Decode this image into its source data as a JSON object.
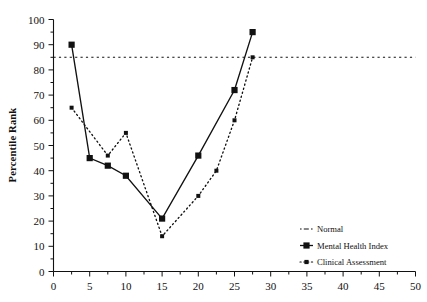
{
  "chart_data": {
    "type": "line",
    "title": "",
    "xlabel": "",
    "ylabel": "Percentile Rank",
    "xlim": [
      0,
      50
    ],
    "ylim": [
      0,
      100
    ],
    "xticks": [
      0,
      5,
      10,
      15,
      20,
      25,
      30,
      35,
      40,
      45,
      50
    ],
    "yticks": [
      0,
      10,
      20,
      30,
      40,
      50,
      60,
      70,
      80,
      90,
      100
    ],
    "xtick_labels": [
      "0",
      "5",
      "10",
      "15",
      "20",
      "25",
      "30",
      "35",
      "40",
      "45",
      "50"
    ],
    "ytick_labels": [
      "0",
      "10",
      "20",
      "30",
      "40",
      "50",
      "60",
      "70",
      "80",
      "90",
      "100"
    ],
    "minor_tick_step": 2.5,
    "grid": false,
    "legend_position": "lower right",
    "series": [
      {
        "name": "Normal",
        "style": "dash-dot",
        "marker": "none",
        "type": "reference-line",
        "value": 85,
        "x": [
          0,
          50
        ],
        "values": [
          85,
          85
        ]
      },
      {
        "name": "Mental Health Index",
        "style": "solid",
        "marker": "square",
        "x": [
          2.5,
          5,
          7.5,
          10,
          15,
          20,
          25,
          27.5
        ],
        "values": [
          90,
          45,
          42,
          38,
          21,
          46,
          72,
          95
        ]
      },
      {
        "name": "Clinical Assessment",
        "style": "dotted",
        "marker": "small-square",
        "x": [
          2.5,
          7.5,
          10,
          15,
          20,
          22.5,
          25,
          27.5
        ],
        "values": [
          65,
          46,
          55,
          14,
          30,
          40,
          60,
          85
        ]
      }
    ]
  },
  "legend": {
    "items": [
      {
        "label": "Normal"
      },
      {
        "label": "Mental Health Index"
      },
      {
        "label": "Clinical Assessment"
      }
    ]
  },
  "axes": {
    "y_title": "Percentile Rank"
  }
}
